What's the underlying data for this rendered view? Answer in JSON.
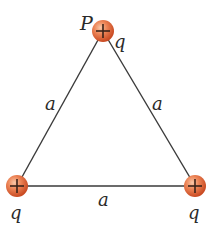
{
  "diagram": {
    "colors": {
      "line": "#3a3a3a",
      "charge_fill_light": "#f6b08a",
      "charge_fill_mid": "#e8764a",
      "charge_fill_dark": "#c94a22",
      "label": "#2a2a2a",
      "background": "#ffffff"
    },
    "charges": [
      {
        "id": "top",
        "sign": "+",
        "label": "q",
        "point_label": "P",
        "cx": 103,
        "cy": 31
      },
      {
        "id": "bottom-left",
        "sign": "+",
        "label": "q",
        "cx": 17,
        "cy": 186
      },
      {
        "id": "bottom-right",
        "sign": "+",
        "label": "q",
        "cx": 195,
        "cy": 186
      }
    ],
    "sides": [
      {
        "id": "left",
        "label": "a"
      },
      {
        "id": "right",
        "label": "a"
      },
      {
        "id": "bottom",
        "label": "a"
      }
    ]
  }
}
